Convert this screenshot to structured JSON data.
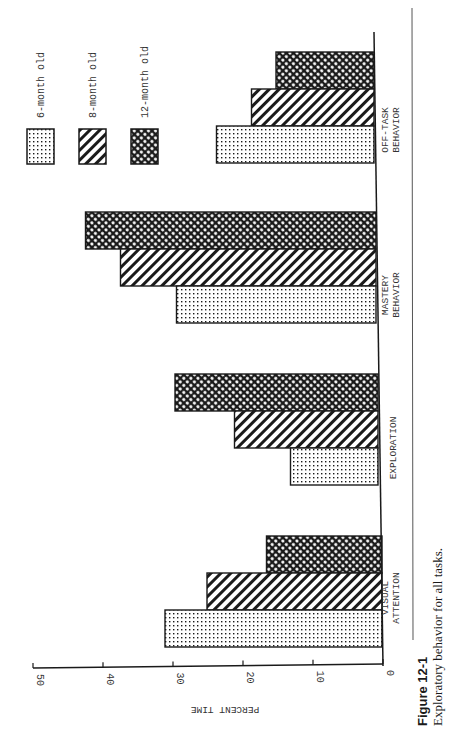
{
  "figure": {
    "number_label": "Figure 12-1",
    "caption": "Exploratory behavior for all tasks."
  },
  "legend": {
    "items": [
      {
        "label": "6-month old",
        "pattern": "dots"
      },
      {
        "label": "8-month old",
        "pattern": "diagonal-hatch"
      },
      {
        "label": "12-month old",
        "pattern": "crosshatch"
      }
    ]
  },
  "axis": {
    "ylabel": "PERCENT TIME",
    "ticks": [
      "0",
      "10",
      "20",
      "30",
      "40",
      "50"
    ]
  },
  "categories": [
    {
      "line1": "VISUAL",
      "line2": "ATTENTION"
    },
    {
      "line1": "EXPLORATION",
      "line2": ""
    },
    {
      "line1": "MASTERY",
      "line2": "BEHAVIOR"
    },
    {
      "line1": "OFF-TASK",
      "line2": "BEHAVIOR"
    }
  ],
  "colors": {
    "ink": "#1a1a1a",
    "paper": "#ffffff"
  },
  "chart_data": {
    "type": "bar",
    "orientation": "rotated 90 degrees clockwise (vertical bar chart printed sideways)",
    "title": "",
    "caption": "Figure 12-1 Exploratory behavior for all tasks.",
    "categories": [
      "Visual Attention",
      "Exploration",
      "Mastery Behavior",
      "Off-Task Behavior"
    ],
    "series": [
      {
        "name": "6-month old",
        "values": [
          31,
          12.5,
          28.5,
          22.5
        ]
      },
      {
        "name": "8-month old",
        "values": [
          25,
          20.5,
          36.5,
          17.5
        ]
      },
      {
        "name": "12-month old",
        "values": [
          16.5,
          29,
          41.5,
          14
        ]
      }
    ],
    "xlabel": "",
    "ylabel": "PERCENT TIME",
    "ylim": [
      0,
      50
    ],
    "yticks": [
      0,
      10,
      20,
      30,
      40,
      50
    ],
    "grid": false,
    "legend_position": "upper-left (rotated)"
  }
}
